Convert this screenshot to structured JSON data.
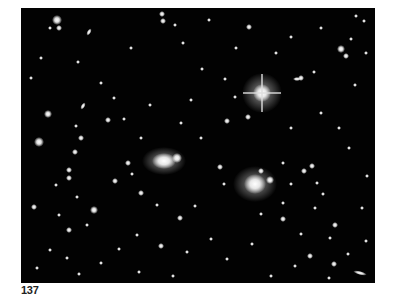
{
  "figure": {
    "caption_number": "137",
    "colors": {
      "background": "#020202",
      "star": "#ffffff",
      "page": "#ffffff"
    }
  }
}
